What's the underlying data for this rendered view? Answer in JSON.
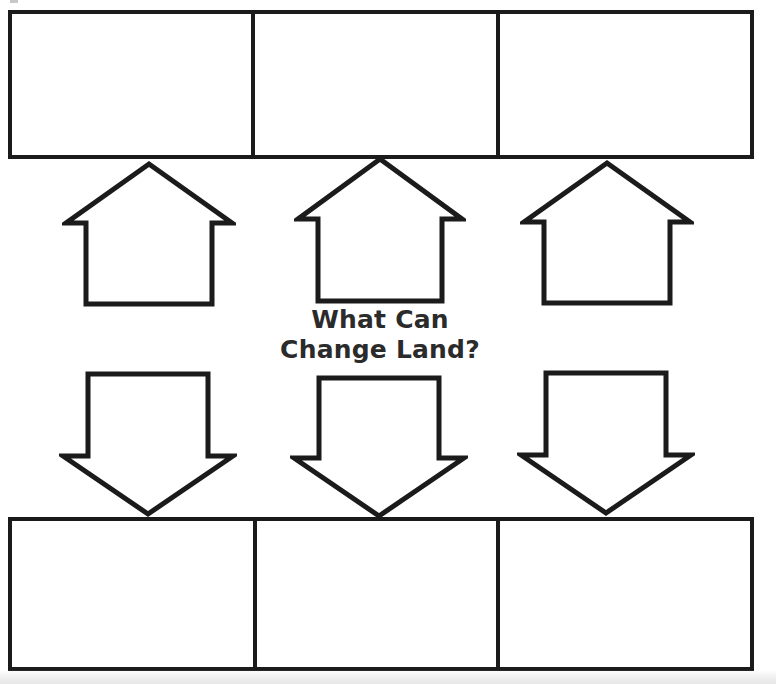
{
  "worksheet": {
    "title": "What Can Change Land?",
    "prompt_line_1": "What Can",
    "prompt_line_2": "Change Land?",
    "prompt_text": "What Can\nChange Land?",
    "ink_color": "#1b1b1b",
    "paper_color": "#ffffff"
  },
  "top_row": {
    "name": "top-answer-boxes",
    "boxes": [
      {
        "id": "top-box-1",
        "value": "",
        "placeholder": ""
      },
      {
        "id": "top-box-2",
        "value": "",
        "placeholder": ""
      },
      {
        "id": "top-box-3",
        "value": "",
        "placeholder": ""
      }
    ]
  },
  "bottom_row": {
    "name": "bottom-answer-boxes",
    "boxes": [
      {
        "id": "bottom-box-1",
        "value": "",
        "placeholder": ""
      },
      {
        "id": "bottom-box-2",
        "value": "",
        "placeholder": ""
      },
      {
        "id": "bottom-box-3",
        "value": "",
        "placeholder": ""
      }
    ]
  },
  "arrows": {
    "up": [
      {
        "id": "arrow-up-1",
        "direction": "up"
      },
      {
        "id": "arrow-up-2",
        "direction": "up"
      },
      {
        "id": "arrow-up-3",
        "direction": "up"
      }
    ],
    "down": [
      {
        "id": "arrow-down-1",
        "direction": "down"
      },
      {
        "id": "arrow-down-2",
        "direction": "down"
      },
      {
        "id": "arrow-down-3",
        "direction": "down"
      }
    ]
  }
}
